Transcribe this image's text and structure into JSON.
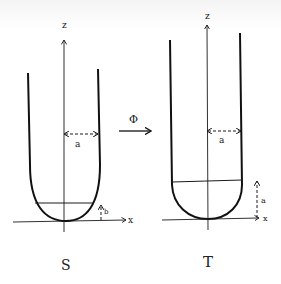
{
  "diagram": {
    "map_label": "Φ",
    "left": {
      "name": "S",
      "z_label": "z",
      "x_label": "x",
      "radius_label": "a",
      "height_label": "b"
    },
    "right": {
      "name": "T",
      "z_label": "z",
      "x_label": "x",
      "radius_label": "a",
      "height_label": "a"
    },
    "colors": {
      "ink": "#1a1a1a",
      "background": "#ffffff"
    }
  }
}
